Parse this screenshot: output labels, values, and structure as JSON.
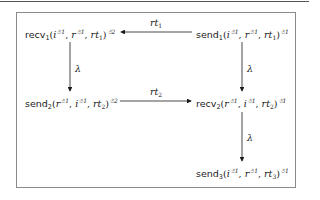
{
  "diagram": {
    "type": "state-transition",
    "nodes": [
      {
        "id": "recv1",
        "fn": "recv",
        "fn_sub": "1",
        "args": [
          {
            "base": "i",
            "sup": "☃1"
          },
          {
            "base": "r",
            "sup": "☃1"
          },
          {
            "base": "rt",
            "sub": "1"
          }
        ],
        "outer_sup": "☃2"
      },
      {
        "id": "send1",
        "fn": "send",
        "fn_sub": "1",
        "args": [
          {
            "base": "i",
            "sup": "☃1"
          },
          {
            "base": "r",
            "sup": "☃1"
          },
          {
            "base": "rt",
            "sub": "1"
          }
        ],
        "outer_sup": "☃1"
      },
      {
        "id": "send2",
        "fn": "send",
        "fn_sub": "2",
        "args": [
          {
            "base": "r",
            "sup": "☃1"
          },
          {
            "base": "i",
            "sup": "☃1"
          },
          {
            "base": "rt",
            "sub": "2"
          }
        ],
        "outer_sup": "☃2"
      },
      {
        "id": "recv2",
        "fn": "recv",
        "fn_sub": "2",
        "args": [
          {
            "base": "r",
            "sup": "☃1"
          },
          {
            "base": "i",
            "sup": "☃1"
          },
          {
            "base": "rt",
            "sub": "2"
          }
        ],
        "outer_sup": "☃1"
      },
      {
        "id": "send3",
        "fn": "send",
        "fn_sub": "3",
        "args": [
          {
            "base": "i",
            "sup": "☃1"
          },
          {
            "base": "r",
            "sup": "☃1"
          },
          {
            "base": "rt",
            "sub": "3"
          }
        ],
        "outer_sup": "☃1"
      }
    ],
    "edges": [
      {
        "from": "send1",
        "to": "recv1",
        "label_base": "rt",
        "label_sub": "1"
      },
      {
        "from": "recv1",
        "to": "send2",
        "label_base": "λ",
        "label_sub": ""
      },
      {
        "from": "send1",
        "to": "recv2",
        "label_base": "λ",
        "label_sub": ""
      },
      {
        "from": "send2",
        "to": "recv2",
        "label_base": "rt",
        "label_sub": "2"
      },
      {
        "from": "recv2",
        "to": "send3",
        "label_base": "λ",
        "label_sub": ""
      }
    ],
    "colors": {
      "line": "#1a1a1a",
      "frame": "#8a8a8a",
      "text": "#1a1a1a"
    }
  }
}
